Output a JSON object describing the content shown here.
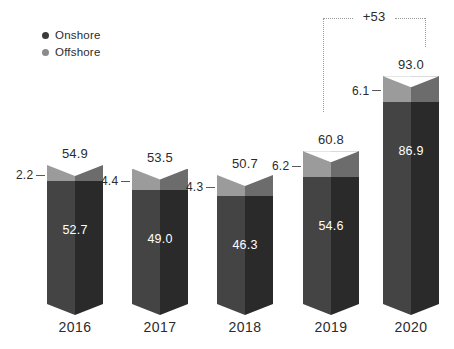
{
  "legend": {
    "items": [
      {
        "label": "Onshore",
        "color": "#3a3a3a"
      },
      {
        "label": "Offshore",
        "color": "#8a8a8a"
      }
    ]
  },
  "annotation": {
    "growth_label": "+53"
  },
  "chart_data": {
    "type": "bar",
    "subtype": "stacked-column-3d",
    "title": "",
    "xlabel": "",
    "ylabel": "",
    "categories": [
      "2016",
      "2017",
      "2018",
      "2019",
      "2020"
    ],
    "series": [
      {
        "name": "Onshore",
        "color": "#3a3a3a",
        "values": [
          52.7,
          49.0,
          46.3,
          54.6,
          86.9
        ]
      },
      {
        "name": "Offshore",
        "color": "#8a8a8a",
        "values": [
          2.2,
          4.4,
          4.3,
          6.2,
          6.1
        ]
      }
    ],
    "totals": [
      54.9,
      53.5,
      50.7,
      60.8,
      93.0
    ],
    "total_labels": [
      "54.9",
      "53.5",
      "50.7",
      "60.8",
      "93.0"
    ],
    "onshore_labels": [
      "52.7",
      "49.0",
      "46.3",
      "54.6",
      "86.9"
    ],
    "offshore_labels": [
      "2.2",
      "4.4",
      "4.3",
      "6.2",
      "6.1"
    ],
    "ylim": [
      0,
      93.0
    ],
    "grid": false,
    "legend_position": "top-left",
    "annotations": [
      {
        "text": "+53",
        "from": "2019",
        "to": "2020",
        "style": "dotted-bracket"
      }
    ]
  }
}
